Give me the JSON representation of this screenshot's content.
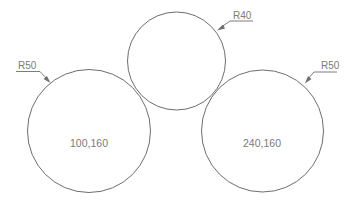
{
  "diagram": {
    "type": "geometric-construction",
    "colors": {
      "stroke": "#6e6e6e",
      "text": "#7a7a7a",
      "background": "#ffffff"
    },
    "circles": [
      {
        "id": "left-circle",
        "center_label": "100,160",
        "radius_label": "R50"
      },
      {
        "id": "top-circle",
        "center_label": "",
        "radius_label": "R40"
      },
      {
        "id": "right-circle",
        "center_label": "240,160",
        "radius_label": "R50"
      }
    ]
  }
}
